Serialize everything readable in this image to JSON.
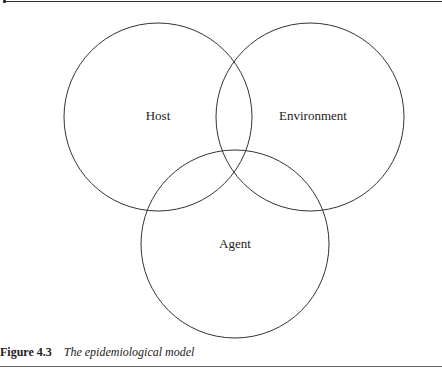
{
  "diagram": {
    "type": "venn",
    "circles": [
      {
        "label": "Host",
        "cx": 158,
        "cy": 117,
        "r": 94
      },
      {
        "label": "Environment",
        "cx": 310,
        "cy": 117,
        "r": 94
      },
      {
        "label": "Agent",
        "cx": 235,
        "cy": 244,
        "r": 94
      }
    ],
    "stroke_color": "#333333"
  },
  "caption": {
    "figure_number": "Figure 4.3",
    "title": "The epidemiological model"
  }
}
